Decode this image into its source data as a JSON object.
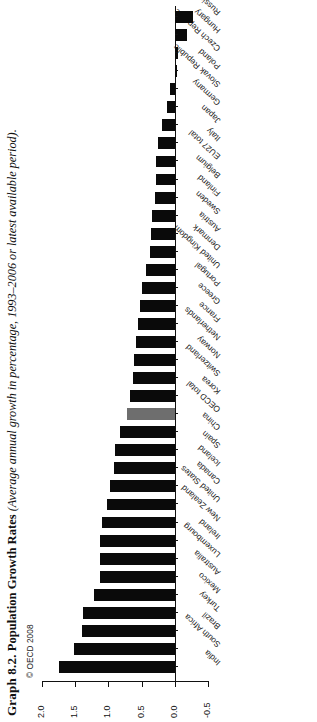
{
  "caption": {
    "number": "Graph 8.2.",
    "title": "Population Growth Rates",
    "subtitle": "(Average annual growth in percentage, 1993–2006 or latest available period)."
  },
  "copyright": "© OECD 2008",
  "chart_data": {
    "type": "bar",
    "orientation": "horizontal",
    "title": "Population Growth Rates",
    "subtitle": "Average annual growth in percentage, 1993–2006 or latest available period",
    "xlabel": "",
    "ylabel": "",
    "value_axis_ticks": [
      "2.0",
      "1.5",
      "1.0",
      "0.5",
      "0.0",
      "-0.5"
    ],
    "value_axis_tick_values": [
      2.0,
      1.5,
      1.0,
      0.5,
      0.0,
      -0.5
    ],
    "ylim": [
      -0.5,
      2.0
    ],
    "grid": false,
    "legend": "none",
    "highlight_category": "OECD total",
    "highlight_color": "#6e6e6e",
    "bar_color": "#0a0a0a",
    "categories": [
      "India",
      "South Africa",
      "Brazil",
      "Turkey",
      "Mexico",
      "Australia",
      "Luxembourg",
      "Ireland",
      "New Zealand",
      "United States",
      "Canada",
      "Iceland",
      "Spain",
      "China",
      "OECD total",
      "Korea",
      "Switzerland",
      "Norway",
      "Netherlands",
      "France",
      "Greece",
      "Portugal",
      "United Kingdom",
      "Denmark",
      "Austria",
      "Sweden",
      "Finland",
      "Belgium",
      "EU27 total",
      "Italy",
      "Japan",
      "Germany",
      "Slovak Republic",
      "Poland",
      "Czech Republic",
      "Hungary",
      "Russian Fed."
    ],
    "values": [
      1.75,
      1.52,
      1.4,
      1.38,
      1.22,
      1.13,
      1.13,
      1.12,
      1.1,
      1.02,
      0.98,
      0.92,
      0.9,
      0.82,
      0.72,
      0.68,
      0.63,
      0.61,
      0.58,
      0.55,
      0.52,
      0.5,
      0.43,
      0.38,
      0.36,
      0.34,
      0.3,
      0.29,
      0.28,
      0.25,
      0.19,
      0.12,
      0.07,
      -0.03,
      -0.05,
      -0.18,
      -0.28
    ]
  }
}
